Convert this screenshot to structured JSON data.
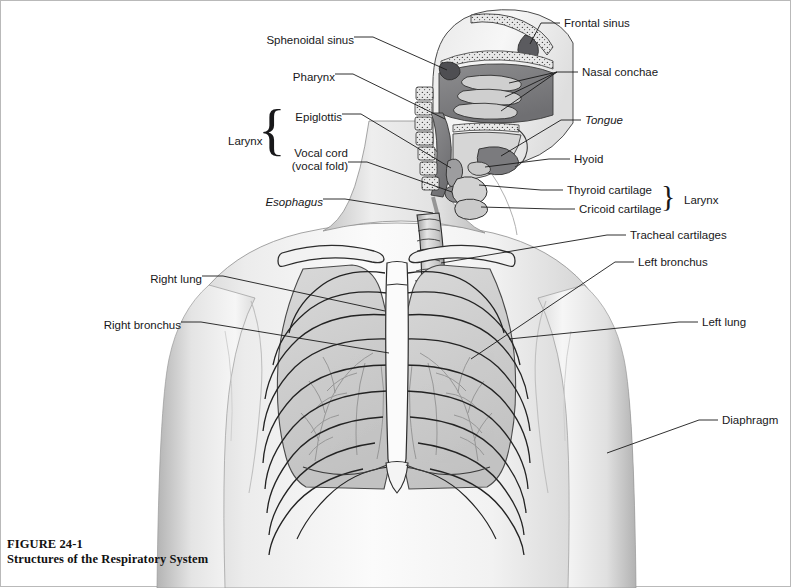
{
  "figure": {
    "caption_number": "FIGURE 24-1",
    "caption_title": "Structures of the Respiratory System",
    "background": "#ffffff",
    "ink": "#18181a",
    "border_color": "#b9b9b9"
  },
  "labels_left": [
    {
      "id": "sphenoidal-sinus",
      "text": "Sphenoidal sinus",
      "x": 249,
      "y": 39,
      "italic": false
    },
    {
      "id": "pharynx",
      "text": "Pharynx",
      "x": 294,
      "y": 76,
      "italic": false
    },
    {
      "id": "epiglottis",
      "text": "Epiglottis",
      "x": 286,
      "y": 116,
      "italic": false
    },
    {
      "id": "vocal-cord",
      "text": "Vocal cord",
      "x": 290,
      "y": 151,
      "italic": false
    },
    {
      "id": "vocal-fold",
      "text": "(vocal fold)",
      "x": 290,
      "y": 164,
      "italic": false
    },
    {
      "id": "larynx-left",
      "text": "Larynx",
      "x": 227,
      "y": 134,
      "italic": false
    },
    {
      "id": "esophagus",
      "text": "Esophagus",
      "x": 252,
      "y": 200,
      "italic": true
    },
    {
      "id": "right-lung",
      "text": "Right lung",
      "x": 140,
      "y": 277,
      "italic": false
    },
    {
      "id": "right-bronchus",
      "text": "Right bronchus",
      "x": 98,
      "y": 323,
      "italic": false
    }
  ],
  "labels_right": [
    {
      "id": "frontal-sinus",
      "text": "Frontal sinus",
      "x": 563,
      "y": 19,
      "italic": false
    },
    {
      "id": "nasal-conchae",
      "text": "Nasal conchae",
      "x": 581,
      "y": 68,
      "italic": false
    },
    {
      "id": "tongue",
      "text": "Tongue",
      "x": 584,
      "y": 116,
      "italic": true
    },
    {
      "id": "hyoid",
      "text": "Hyoid",
      "x": 573,
      "y": 155,
      "italic": false
    },
    {
      "id": "thyroid-cartilage",
      "text": "Thyroid cartilage",
      "x": 566,
      "y": 186,
      "italic": false
    },
    {
      "id": "cricoid-cartilage",
      "text": "Cricoid cartilage",
      "x": 578,
      "y": 205,
      "italic": false
    },
    {
      "id": "larynx-right",
      "text": "Larynx",
      "x": 683,
      "y": 196,
      "italic": false
    },
    {
      "id": "tracheal-cartilages",
      "text": "Tracheal cartilages",
      "x": 629,
      "y": 231,
      "italic": false
    },
    {
      "id": "left-bronchus",
      "text": "Left bronchus",
      "x": 637,
      "y": 258,
      "italic": false
    },
    {
      "id": "left-lung",
      "text": "Left lung",
      "x": 701,
      "y": 318,
      "italic": false
    },
    {
      "id": "diaphragm",
      "text": "Diaphragm",
      "x": 721,
      "y": 416,
      "italic": false
    }
  ],
  "braces": [
    {
      "id": "brace-larynx-left",
      "glyph": "{",
      "x": 259,
      "y": 106,
      "height": 68
    },
    {
      "id": "brace-larynx-right",
      "glyph": "}",
      "x": 661,
      "y": 184,
      "height": 30
    }
  ],
  "anatomy_parts": [
    "frontal-sinus",
    "sphenoidal-sinus",
    "nasal-conchae",
    "nasal-cavity",
    "tongue",
    "pharynx",
    "epiglottis",
    "vocal-cord",
    "hyoid",
    "thyroid-cartilage",
    "cricoid-cartilage",
    "esophagus",
    "trachea",
    "tracheal-cartilages",
    "right-bronchus",
    "left-bronchus",
    "right-lung",
    "left-lung",
    "bronchial-tree",
    "rib-cage",
    "clavicle",
    "sternum",
    "diaphragm",
    "cervical-vertebrae",
    "torso-outline"
  ]
}
